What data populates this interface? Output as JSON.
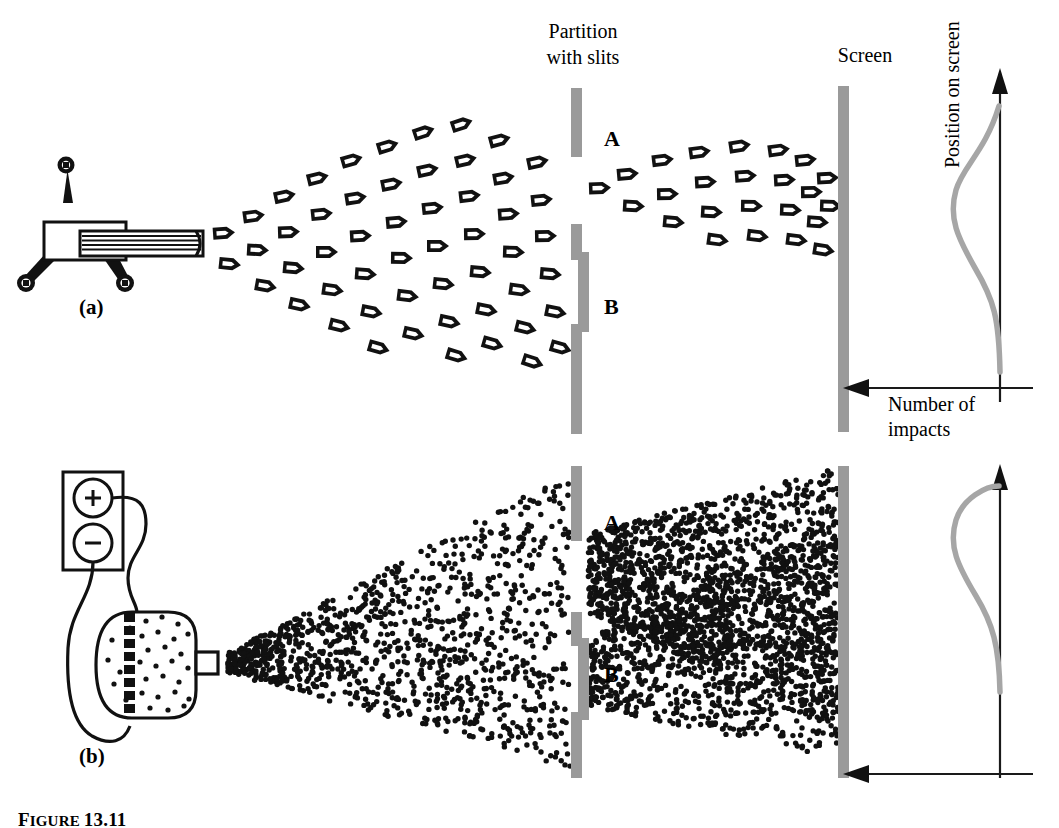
{
  "figure": {
    "caption_prefix": "Figure",
    "caption_number": "13.11",
    "panel_a_label": "(a)",
    "panel_b_label": "(b)"
  },
  "labels": {
    "partition": "Partition\nwith slits",
    "screen": "Screen",
    "slit_a_top": "A",
    "slit_b_top": "B",
    "slit_a_bottom": "A",
    "slit_b_bottom": "B",
    "number_of_impacts": "Number of\nimpacts",
    "position_on_screen": "Position on screen",
    "battery_plus": "+",
    "battery_minus": "−"
  },
  "colors": {
    "bar_gray": "#9a9a9a",
    "curve_gray": "#a6a6a6",
    "ink": "#000000",
    "background": "#ffffff"
  },
  "chart_data": [
    {
      "id": "bullets-distribution",
      "type": "line",
      "title": "",
      "xlabel": "Number of impacts",
      "ylabel": "Position on screen",
      "axis_direction_x": "leftward",
      "axis_direction_y": "upward",
      "grid": false,
      "legend": "none",
      "description": "Single broad peak of bullet impacts centered behind the slits",
      "y": [
        0,
        10,
        20,
        30,
        40,
        50,
        60,
        70,
        80,
        90,
        100
      ],
      "values": [
        2,
        3,
        6,
        18,
        52,
        92,
        100,
        70,
        28,
        9,
        3
      ]
    },
    {
      "id": "electrons-distribution",
      "type": "line",
      "title": "",
      "xlabel": "Number of impacts",
      "ylabel": "Position on screen",
      "axis_direction_x": "leftward",
      "axis_direction_y": "upward",
      "grid": false,
      "legend": "none",
      "description": "Single broad peak of electron impacts centered behind the slits",
      "y": [
        0,
        10,
        20,
        30,
        40,
        50,
        60,
        70,
        80,
        90,
        100
      ],
      "values": [
        2,
        4,
        9,
        26,
        62,
        95,
        100,
        72,
        30,
        10,
        3
      ]
    }
  ]
}
